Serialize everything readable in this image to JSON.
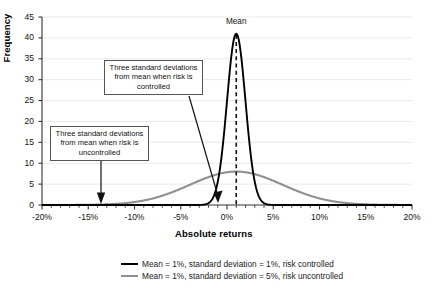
{
  "chart_data": {
    "type": "line",
    "title": "",
    "xlabel": "Absolute returns",
    "ylabel": "Frequency",
    "xlim": [
      -20,
      20
    ],
    "ylim": [
      0,
      45
    ],
    "xtick_labels": [
      "-20%",
      "-15%",
      "-10%",
      "-5%",
      "0%",
      "5%",
      "10%",
      "15%",
      "20%"
    ],
    "xtick_values": [
      -20,
      -15,
      -10,
      -5,
      0,
      5,
      10,
      15,
      20
    ],
    "ytick_labels": [
      "0",
      "5",
      "10",
      "15",
      "20",
      "25",
      "30",
      "35",
      "40",
      "45"
    ],
    "ytick_values": [
      0,
      5,
      10,
      15,
      20,
      25,
      30,
      35,
      40,
      45
    ],
    "minor_tick_step": 1,
    "grid": "horizontal",
    "legend_position": "bottom",
    "series": [
      {
        "name": "Mean = 1%, standard deviation = 1%, risk controlled",
        "color": "#000000",
        "mean": 1,
        "std": 1,
        "peak": 41,
        "style": "solid-thick"
      },
      {
        "name": "Mean = 1%, standard deviation = 5%, risk uncontrolled",
        "color": "#8f8f8f",
        "mean": 1,
        "std": 5,
        "peak": 8,
        "style": "solid-medium"
      }
    ],
    "annotations": [
      {
        "id": "mean-line",
        "label": "Mean",
        "x": 1,
        "style": "dashed-vertical"
      },
      {
        "id": "three-sd-controlled",
        "label": "Three standard deviations from mean when risk is controlled",
        "points_to_x": -2,
        "points_to_y": 0
      },
      {
        "id": "three-sd-uncontrolled",
        "label": "Three standard deviations from mean when risk is uncontrolled",
        "points_to_x": -14,
        "points_to_y": 0
      }
    ]
  },
  "labels": {
    "y_title": "Frequency",
    "x_title": "Absolute returns",
    "mean": "Mean",
    "callout_controlled": "Three standard deviations from mean when risk is controlled",
    "callout_uncontrolled": "Three standard deviations from mean when risk is uncontrolled",
    "legend_1": "Mean = 1%, standard deviation = 1%, risk controlled",
    "legend_2": "Mean = 1%, standard deviation = 5%, risk uncontrolled"
  },
  "colors": {
    "controlled": "#000000",
    "uncontrolled": "#8f8f8f",
    "grid": "#e8e8e8",
    "axis": "#333333"
  }
}
